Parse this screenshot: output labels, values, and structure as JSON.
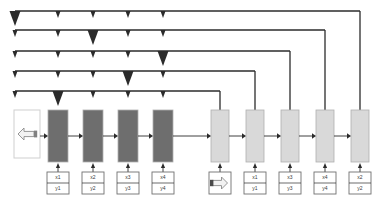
{
  "diagram": {
    "colors": {
      "dark_block": "#6e6e6e",
      "light_block": "#d9d9d9",
      "block_border": "#b0b0b0",
      "line": "#2b2b2b",
      "label_box_border": "#707070",
      "label_text": "#3a3a3a",
      "source_box_fill": "#ffffff",
      "source_box_border": "#cfcfcf",
      "arrow_glyph_fill": "#f2f2f2",
      "arrow_glyph_border": "#8a8a8a",
      "background": "#ffffff"
    },
    "source_node": {
      "name": "input-source",
      "icon": "left-arrow-icon",
      "x": 14,
      "y": 110,
      "width": 26,
      "height": 48
    },
    "stage_blocks": [
      {
        "id": "d1",
        "kind": "dark",
        "x": 48,
        "y": 110,
        "width": 20,
        "height": 52
      },
      {
        "id": "d2",
        "kind": "dark",
        "x": 83,
        "y": 110,
        "width": 20,
        "height": 52
      },
      {
        "id": "d3",
        "kind": "dark",
        "x": 118,
        "y": 110,
        "width": 20,
        "height": 52
      },
      {
        "id": "d4",
        "kind": "dark",
        "x": 153,
        "y": 110,
        "width": 20,
        "height": 52
      },
      {
        "id": "l1",
        "kind": "light",
        "x": 211,
        "y": 110,
        "width": 18,
        "height": 52
      },
      {
        "id": "l2",
        "kind": "light",
        "x": 246,
        "y": 110,
        "width": 18,
        "height": 52
      },
      {
        "id": "l3",
        "kind": "light",
        "x": 281,
        "y": 110,
        "width": 18,
        "height": 52
      },
      {
        "id": "l4",
        "kind": "light",
        "x": 316,
        "y": 110,
        "width": 18,
        "height": 52
      },
      {
        "id": "l5",
        "kind": "light",
        "x": 351,
        "y": 110,
        "width": 18,
        "height": 52
      }
    ],
    "param_boxes": [
      {
        "id": "p1",
        "for": "d1",
        "x": 47,
        "y": 172,
        "width": 22,
        "height": 22,
        "top": "x1",
        "bottom": "y1",
        "icon": null
      },
      {
        "id": "p2",
        "for": "d2",
        "x": 82,
        "y": 172,
        "width": 22,
        "height": 22,
        "top": "x2",
        "bottom": "y2",
        "icon": null
      },
      {
        "id": "p3",
        "for": "d3",
        "x": 117,
        "y": 172,
        "width": 22,
        "height": 22,
        "top": "x3",
        "bottom": "y3",
        "icon": null
      },
      {
        "id": "p4",
        "for": "d4",
        "x": 152,
        "y": 172,
        "width": 22,
        "height": 22,
        "top": "x4",
        "bottom": "y4",
        "icon": null
      },
      {
        "id": "p5",
        "for": "l1",
        "x": 209,
        "y": 172,
        "width": 22,
        "height": 22,
        "top": "",
        "bottom": "",
        "icon": "right-arrow-icon"
      },
      {
        "id": "p6",
        "for": "l2",
        "x": 244,
        "y": 172,
        "width": 22,
        "height": 22,
        "top": "x1",
        "bottom": "y1",
        "icon": null
      },
      {
        "id": "p7",
        "for": "l3",
        "x": 279,
        "y": 172,
        "width": 22,
        "height": 22,
        "top": "x3",
        "bottom": "y3",
        "icon": null
      },
      {
        "id": "p8",
        "for": "l4",
        "x": 314,
        "y": 172,
        "width": 22,
        "height": 22,
        "top": "x4",
        "bottom": "y4",
        "icon": null
      },
      {
        "id": "p9",
        "for": "l5",
        "x": 349,
        "y": 172,
        "width": 22,
        "height": 22,
        "top": "x2",
        "bottom": "y2",
        "icon": null
      }
    ],
    "feedback_lines": [
      {
        "id": "f1",
        "y": 11,
        "left_x": 15,
        "source_x": 360,
        "drop_to_y": 110,
        "emphasis_index": 0
      },
      {
        "id": "f2",
        "y": 30,
        "left_x": 15,
        "source_x": 325,
        "drop_to_y": 110,
        "emphasis_index": 2
      },
      {
        "id": "f3",
        "y": 51,
        "left_x": 15,
        "source_x": 290,
        "drop_to_y": 110,
        "emphasis_index": 4
      },
      {
        "id": "f4",
        "y": 71,
        "left_x": 15,
        "source_x": 255,
        "drop_to_y": 110,
        "emphasis_index": 3
      },
      {
        "id": "f5",
        "y": 91,
        "left_x": 15,
        "source_x": 220,
        "drop_to_y": 110,
        "emphasis_index": 1
      }
    ],
    "feedback_arrow_columns": [
      15,
      58,
      93,
      128,
      163
    ],
    "arrowhead": {
      "small_width": 5,
      "small_height": 7,
      "large_width": 11,
      "large_height": 15
    }
  }
}
